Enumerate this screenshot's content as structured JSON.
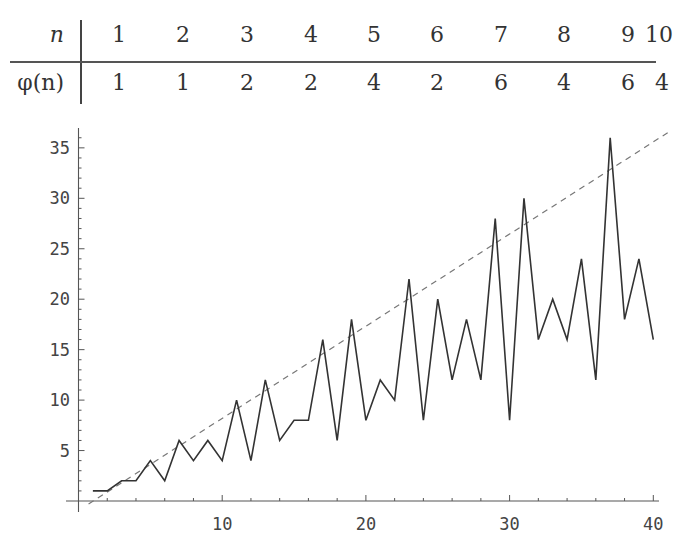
{
  "table": {
    "header_label": "n",
    "value_label": "φ(n)",
    "n": [
      "1",
      "2",
      "3",
      "4",
      "5",
      "6",
      "7",
      "8",
      "9",
      "10"
    ],
    "phi": [
      "1",
      "1",
      "2",
      "2",
      "4",
      "2",
      "6",
      "4",
      "6",
      "4"
    ]
  },
  "chart_data": {
    "type": "line",
    "title": "",
    "xlabel": "",
    "ylabel": "",
    "x": [
      1,
      2,
      3,
      4,
      5,
      6,
      7,
      8,
      9,
      10,
      11,
      12,
      13,
      14,
      15,
      16,
      17,
      18,
      19,
      20,
      21,
      22,
      23,
      24,
      25,
      26,
      27,
      28,
      29,
      30,
      31,
      32,
      33,
      34,
      35,
      36,
      37,
      38,
      39,
      40
    ],
    "series": [
      {
        "name": "φ(n)",
        "style": "solid",
        "values": [
          1,
          1,
          2,
          2,
          4,
          2,
          6,
          4,
          6,
          4,
          10,
          4,
          12,
          6,
          8,
          8,
          16,
          6,
          18,
          8,
          12,
          10,
          22,
          8,
          20,
          12,
          18,
          12,
          28,
          8,
          30,
          16,
          20,
          16,
          24,
          12,
          36,
          18,
          24,
          16
        ]
      },
      {
        "name": "y = n",
        "style": "dashed",
        "from": [
          0,
          -1
        ],
        "to": [
          41,
          39
        ]
      }
    ],
    "xticks": [
      "10",
      "20",
      "30",
      "40"
    ],
    "yticks": [
      "5",
      "10",
      "15",
      "20",
      "25",
      "30",
      "35"
    ],
    "xlim": [
      0,
      41
    ],
    "ylim": [
      0,
      37
    ],
    "grid": false,
    "legend": null
  }
}
